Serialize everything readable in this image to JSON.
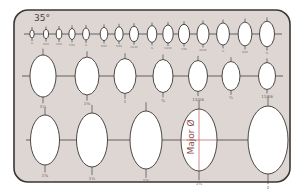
{
  "template": {
    "angle_label": "35°",
    "axis_label": "Major Ø",
    "colors": {
      "background": "#ffffff",
      "plate_fill": "#ddd6d2",
      "plate_border": "#3a3634",
      "line": "#4a4442",
      "ellipse_fill": "#ffffff",
      "major_axis_line": "#c0565a"
    },
    "rows": [
      {
        "name": "row-small",
        "y": 34,
        "line_x": [
          24,
          282
        ],
        "ellipses": [
          {
            "x": 32,
            "rx": 2.2,
            "ry": 4,
            "label": "⅛"
          },
          {
            "x": 46,
            "rx": 2.5,
            "ry": 4.5,
            "label": "5/32"
          },
          {
            "x": 59,
            "rx": 2.8,
            "ry": 5,
            "label": "3/16"
          },
          {
            "x": 72,
            "rx": 3.1,
            "ry": 5.5,
            "label": "7/32"
          },
          {
            "x": 86,
            "rx": 3.4,
            "ry": 6,
            "label": "¼"
          },
          {
            "x": 104,
            "rx": 3.8,
            "ry": 6.6,
            "label": "9/32"
          },
          {
            "x": 119,
            "rx": 4.1,
            "ry": 7.2,
            "label": "5/16"
          },
          {
            "x": 134,
            "rx": 4.5,
            "ry": 7.8,
            "label": "11/32"
          },
          {
            "x": 152,
            "rx": 4.8,
            "ry": 8.4,
            "label": "⅜"
          },
          {
            "x": 168,
            "rx": 5.2,
            "ry": 9,
            "label": "13/32"
          },
          {
            "x": 184,
            "rx": 5.6,
            "ry": 9.7,
            "label": "7/16"
          },
          {
            "x": 203,
            "rx": 6,
            "ry": 10.4,
            "label": "15/32"
          },
          {
            "x": 223,
            "rx": 6.4,
            "ry": 11.1,
            "label": "½"
          },
          {
            "x": 245,
            "rx": 6.9,
            "ry": 11.9,
            "label": "9/16"
          },
          {
            "x": 267,
            "rx": 7.5,
            "ry": 12.8,
            "label": "⅝"
          }
        ]
      },
      {
        "name": "row-medium",
        "y": 76,
        "line_x": [
          22,
          283
        ],
        "ellipses": [
          {
            "x": 43,
            "rx": 13,
            "ry": 21,
            "label": "1¼"
          },
          {
            "x": 87,
            "rx": 12,
            "ry": 19,
            "label": "1⅛"
          },
          {
            "x": 125,
            "rx": 11,
            "ry": 17.5,
            "label": "1"
          },
          {
            "x": 163,
            "rx": 10,
            "ry": 16.5,
            "label": "⅞"
          },
          {
            "x": 198,
            "rx": 9.5,
            "ry": 15.5,
            "label": "13/16"
          },
          {
            "x": 231,
            "rx": 9,
            "ry": 14.5,
            "label": "¾"
          },
          {
            "x": 267,
            "rx": 8.5,
            "ry": 13.5,
            "label": "11/16"
          }
        ]
      },
      {
        "name": "row-large",
        "y": 140,
        "line_x": [
          26,
          287
        ],
        "ellipses": [
          {
            "x": 45,
            "rx": 14.5,
            "ry": 25,
            "label": "1⅜"
          },
          {
            "x": 92,
            "rx": 15.5,
            "ry": 27,
            "label": "1½"
          },
          {
            "x": 146,
            "rx": 16,
            "ry": 29,
            "label": "1⅝"
          },
          {
            "x": 199,
            "rx": 18,
            "ry": 31,
            "label": "1¾",
            "major_axis": true
          },
          {
            "x": 268,
            "rx": 20,
            "ry": 34,
            "label": "2"
          }
        ]
      }
    ]
  }
}
